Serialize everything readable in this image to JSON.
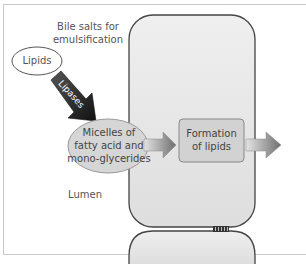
{
  "diagram": {
    "bile_label": "Bile salts for emulsification",
    "bile_line1": "Bile salts for",
    "bile_line2": "emulsification",
    "lipids_label": "Lipids",
    "lipases_label": "Lipases",
    "micelles_line1": "Micelles of",
    "micelles_line2": "fatty acid and",
    "micelles_line3": "mono-glycerides",
    "formation_line1": "Formation",
    "formation_line2": "of lipids",
    "lumen_label": "Lumen",
    "colors": {
      "cell_fill": "#e6e6e6",
      "cell_stroke": "#444444",
      "micelle_fill": "#d6d6d6",
      "lipases_arrow": "#222222",
      "arrow_gray": "#8a8a8a",
      "box_fill": "#d2d2d2",
      "frame": "#c8c8c8"
    }
  }
}
